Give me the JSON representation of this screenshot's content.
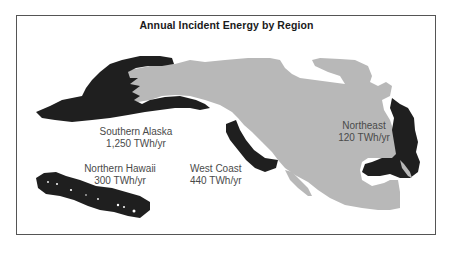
{
  "map": {
    "title": "Annual Incident Energy by Region",
    "colors": {
      "land": "#b8b8b8",
      "region": "#1f1f1f",
      "frame": "#555555",
      "label": "#4a4a4a",
      "title": "#1a1a1a"
    },
    "regions": [
      {
        "name": "Southern Alaska",
        "value": "1,250 TWh/yr"
      },
      {
        "name": "Northern Hawaii",
        "value": "300 TWh/yr"
      },
      {
        "name": "West Coast",
        "value": "440 TWh/yr"
      },
      {
        "name": "Northeast",
        "value": "120 TWh/yr"
      }
    ]
  }
}
